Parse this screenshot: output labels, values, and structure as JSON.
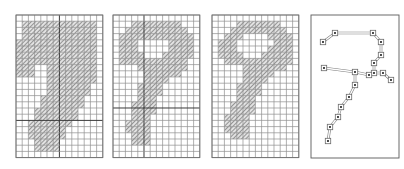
{
  "figure": {
    "background_color": "#ffffff",
    "width": 404,
    "height": 169,
    "panel_count": 4
  },
  "style": {
    "grid_minor_color": "#8f8f8f",
    "grid_major_color": "#3a3a3a",
    "panel_border_color": "#6e6e6e",
    "hatch_color": "#6a6a6a",
    "hatch_background": "#e2e2e2",
    "skeleton_edge_color": "#7d7d7d",
    "skeleton_node_fill": "#ffffff",
    "skeleton_node_dot_color": "#1d1d1d"
  },
  "panels": [
    {
      "id": "panel-original",
      "label": "original",
      "type": "raster-grid",
      "x": 15,
      "y": 14,
      "cell": 6.2,
      "cols": 14,
      "rows": 23,
      "major_cols": [
        7
      ],
      "major_rows": [
        17
      ],
      "filled_runs": [
        {
          "row": 1,
          "from": 1,
          "to": 12
        },
        {
          "row": 2,
          "from": 1,
          "to": 12
        },
        {
          "row": 3,
          "from": 1,
          "to": 12
        },
        {
          "row": 4,
          "from": 0,
          "to": 12
        },
        {
          "row": 5,
          "from": 0,
          "to": 12
        },
        {
          "row": 6,
          "from": 0,
          "to": 12
        },
        {
          "row": 7,
          "from": 0,
          "to": 12
        },
        {
          "row": 8,
          "from": 0,
          "to": 2
        },
        {
          "row": 8,
          "from": 5,
          "to": 12
        },
        {
          "row": 9,
          "from": 0,
          "to": 2
        },
        {
          "row": 9,
          "from": 5,
          "to": 12
        },
        {
          "row": 10,
          "from": 5,
          "to": 12
        },
        {
          "row": 11,
          "from": 5,
          "to": 11
        },
        {
          "row": 12,
          "from": 5,
          "to": 11
        },
        {
          "row": 13,
          "from": 4,
          "to": 10
        },
        {
          "row": 14,
          "from": 4,
          "to": 10
        },
        {
          "row": 15,
          "from": 3,
          "to": 9
        },
        {
          "row": 16,
          "from": 3,
          "to": 9
        },
        {
          "row": 17,
          "from": 2,
          "to": 8
        },
        {
          "row": 18,
          "from": 2,
          "to": 7
        },
        {
          "row": 19,
          "from": 2,
          "to": 7
        },
        {
          "row": 20,
          "from": 3,
          "to": 6
        },
        {
          "row": 21,
          "from": 3,
          "to": 6
        }
      ]
    },
    {
      "id": "panel-thinned-1",
      "label": "after first thinning pass",
      "type": "raster-grid",
      "x": 112,
      "y": 14,
      "cell": 6.2,
      "cols": 14,
      "rows": 23,
      "major_cols": [
        5
      ],
      "major_rows": [
        15
      ],
      "filled_runs": [
        {
          "row": 1,
          "from": 3,
          "to": 10
        },
        {
          "row": 2,
          "from": 2,
          "to": 11
        },
        {
          "row": 3,
          "from": 1,
          "to": 12
        },
        {
          "row": 4,
          "from": 1,
          "to": 3
        },
        {
          "row": 4,
          "from": 9,
          "to": 12
        },
        {
          "row": 5,
          "from": 1,
          "to": 3
        },
        {
          "row": 5,
          "from": 9,
          "to": 12
        },
        {
          "row": 6,
          "from": 1,
          "to": 4
        },
        {
          "row": 6,
          "from": 8,
          "to": 12
        },
        {
          "row": 7,
          "from": 1,
          "to": 11
        },
        {
          "row": 8,
          "from": 4,
          "to": 11
        },
        {
          "row": 9,
          "from": 5,
          "to": 10
        },
        {
          "row": 10,
          "from": 5,
          "to": 8
        },
        {
          "row": 11,
          "from": 4,
          "to": 7
        },
        {
          "row": 12,
          "from": 4,
          "to": 7
        },
        {
          "row": 13,
          "from": 4,
          "to": 6
        },
        {
          "row": 14,
          "from": 3,
          "to": 6
        },
        {
          "row": 15,
          "from": 3,
          "to": 6
        },
        {
          "row": 16,
          "from": 3,
          "to": 5
        },
        {
          "row": 17,
          "from": 2,
          "to": 5
        },
        {
          "row": 18,
          "from": 2,
          "to": 5
        },
        {
          "row": 19,
          "from": 3,
          "to": 5
        },
        {
          "row": 20,
          "from": 3,
          "to": 5
        }
      ]
    },
    {
      "id": "panel-thinned-2",
      "label": "after second thinning pass",
      "type": "raster-grid",
      "x": 211,
      "y": 14,
      "cell": 6.2,
      "cols": 14,
      "rows": 23,
      "major_cols": [],
      "major_rows": [],
      "filled_runs": [
        {
          "row": 1,
          "from": 4,
          "to": 10
        },
        {
          "row": 2,
          "from": 3,
          "to": 11
        },
        {
          "row": 3,
          "from": 2,
          "to": 4
        },
        {
          "row": 3,
          "from": 9,
          "to": 12
        },
        {
          "row": 4,
          "from": 1,
          "to": 3
        },
        {
          "row": 4,
          "from": 10,
          "to": 12
        },
        {
          "row": 5,
          "from": 1,
          "to": 3
        },
        {
          "row": 5,
          "from": 9,
          "to": 12
        },
        {
          "row": 6,
          "from": 1,
          "to": 4
        },
        {
          "row": 6,
          "from": 8,
          "to": 12
        },
        {
          "row": 7,
          "from": 2,
          "to": 12
        },
        {
          "row": 8,
          "from": 5,
          "to": 11
        },
        {
          "row": 9,
          "from": 5,
          "to": 9
        },
        {
          "row": 10,
          "from": 5,
          "to": 8
        },
        {
          "row": 11,
          "from": 4,
          "to": 7
        },
        {
          "row": 12,
          "from": 4,
          "to": 7
        },
        {
          "row": 13,
          "from": 4,
          "to": 6
        },
        {
          "row": 14,
          "from": 3,
          "to": 6
        },
        {
          "row": 15,
          "from": 3,
          "to": 6
        },
        {
          "row": 16,
          "from": 2,
          "to": 5
        },
        {
          "row": 17,
          "from": 2,
          "to": 5
        },
        {
          "row": 18,
          "from": 2,
          "to": 5
        },
        {
          "row": 19,
          "from": 3,
          "to": 5
        }
      ]
    },
    {
      "id": "panel-skeleton-graph",
      "label": "extracted skeleton graph",
      "type": "skeleton-graph",
      "x": 310,
      "y": 14,
      "width": 88,
      "height": 143,
      "nodes": [
        {
          "id": "n1",
          "x": 12,
          "y": 27
        },
        {
          "id": "n2",
          "x": 24,
          "y": 18
        },
        {
          "id": "n3",
          "x": 62,
          "y": 18
        },
        {
          "id": "n4",
          "x": 70,
          "y": 27
        },
        {
          "id": "n5",
          "x": 70,
          "y": 40
        },
        {
          "id": "n6",
          "x": 63,
          "y": 48
        },
        {
          "id": "n7",
          "x": 63,
          "y": 58
        },
        {
          "id": "n8",
          "x": 72,
          "y": 58
        },
        {
          "id": "n9",
          "x": 80,
          "y": 65
        },
        {
          "id": "n10",
          "x": 58,
          "y": 60
        },
        {
          "id": "n11",
          "x": 44,
          "y": 57
        },
        {
          "id": "n12",
          "x": 13,
          "y": 53
        },
        {
          "id": "n13",
          "x": 44,
          "y": 70
        },
        {
          "id": "n14",
          "x": 38,
          "y": 82
        },
        {
          "id": "n15",
          "x": 30,
          "y": 92
        },
        {
          "id": "n16",
          "x": 27,
          "y": 102
        },
        {
          "id": "n17",
          "x": 19,
          "y": 112
        },
        {
          "id": "n18",
          "x": 17,
          "y": 126
        }
      ],
      "edges": [
        {
          "from": "n1",
          "to": "n2"
        },
        {
          "from": "n2",
          "to": "n3"
        },
        {
          "from": "n3",
          "to": "n4"
        },
        {
          "from": "n4",
          "to": "n5"
        },
        {
          "from": "n5",
          "to": "n6"
        },
        {
          "from": "n6",
          "to": "n7"
        },
        {
          "from": "n7",
          "to": "n8"
        },
        {
          "from": "n8",
          "to": "n9"
        },
        {
          "from": "n7",
          "to": "n10"
        },
        {
          "from": "n10",
          "to": "n11"
        },
        {
          "from": "n11",
          "to": "n12"
        },
        {
          "from": "n11",
          "to": "n13"
        },
        {
          "from": "n13",
          "to": "n14"
        },
        {
          "from": "n14",
          "to": "n15"
        },
        {
          "from": "n15",
          "to": "n16"
        },
        {
          "from": "n16",
          "to": "n17"
        },
        {
          "from": "n17",
          "to": "n18"
        }
      ],
      "node_count": 18,
      "edge_count": 17
    }
  ]
}
